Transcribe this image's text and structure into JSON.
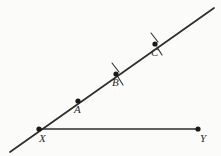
{
  "figure": {
    "background_color": "#fbfbfa",
    "stroke_color": "#2e2e2e",
    "point_color": "#1a1a1a",
    "canvas": {
      "width": 221,
      "height": 156
    }
  },
  "points": {
    "X": {
      "label": "X",
      "x": 39,
      "y": 129,
      "label_x": 39,
      "label_y": 133
    },
    "Y": {
      "label": "Y",
      "x": 198,
      "y": 129,
      "label_x": 200,
      "label_y": 133
    },
    "A": {
      "label": "A",
      "x": 78,
      "y": 101,
      "label_x": 74,
      "label_y": 104
    },
    "B": {
      "label": "B",
      "x": 116,
      "y": 74,
      "label_x": 112,
      "label_y": 77
    },
    "C": {
      "label": "C",
      "x": 155,
      "y": 44,
      "label_x": 151,
      "label_y": 47
    }
  },
  "lines": {
    "ray_XC": {
      "name": "line through X A B C",
      "from": {
        "x": 10,
        "y": 152
      },
      "to": {
        "x": 214,
        "y": 8
      },
      "stroke_width": 1.7
    },
    "segment_XY": {
      "name": "segment X to Y",
      "from": {
        "x": 39,
        "y": 129
      },
      "to": {
        "x": 198,
        "y": 129
      },
      "stroke_width": 1.5
    }
  },
  "tick_marks": {
    "B_upper": {
      "x1": 112,
      "y1": 63,
      "x2": 119,
      "y2": 72
    },
    "B_lower": {
      "x1": 118,
      "y1": 77,
      "x2": 123,
      "y2": 85
    },
    "C_upper": {
      "x1": 151,
      "y1": 33,
      "x2": 158,
      "y2": 42
    },
    "C_lower": {
      "x1": 157,
      "y1": 47,
      "x2": 162,
      "y2": 55
    }
  },
  "dot_radius": 2.6
}
